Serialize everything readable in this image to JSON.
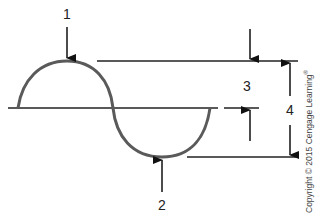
{
  "diagram": {
    "type": "wave-anatomy",
    "labels": {
      "crest": "1",
      "trough": "2",
      "amplitude": "3",
      "wave_height": "4"
    },
    "copyright": "Copyright © 2015 Cengage Learning",
    "copyright_mark": "®",
    "colors": {
      "wave": "#555555",
      "lines": "#222222",
      "text": "#222222"
    }
  }
}
